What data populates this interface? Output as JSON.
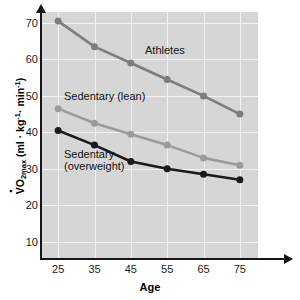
{
  "chart_data": {
    "type": "line",
    "title": "",
    "xlabel": "Age",
    "ylabel": "VO2max (ml · kg-1 · min-1)",
    "categories": [
      25,
      35,
      45,
      55,
      65,
      75
    ],
    "x": [
      25,
      35,
      45,
      55,
      65,
      75
    ],
    "xlim": [
      20,
      80
    ],
    "ylim": [
      5,
      73
    ],
    "xticks": [
      "25",
      "35",
      "45",
      "55",
      "65",
      "75"
    ],
    "yticks": [
      "10",
      "20",
      "30",
      "40",
      "50",
      "60",
      "70"
    ],
    "grid": true,
    "legend_position": "inline-annotations",
    "series": [
      {
        "name": "Athletes",
        "color": "#7d7d7d",
        "values": [
          70.5,
          63.5,
          59.0,
          54.5,
          50.0,
          45.0
        ]
      },
      {
        "name": "Sedentary (lean)",
        "color": "#9b9b9b",
        "values": [
          46.5,
          42.5,
          39.5,
          36.5,
          33.0,
          31.0
        ]
      },
      {
        "name": "Sedentary (overweight)",
        "color": "#1b1b1b",
        "values": [
          40.5,
          36.5,
          32.0,
          30.0,
          28.5,
          27.0
        ]
      }
    ],
    "annotations": [
      {
        "text": "Athletes"
      },
      {
        "text": "Sedentary (lean)"
      },
      {
        "text": "Sedentary",
        "text2": "(overweight)"
      }
    ],
    "plot_background": "#d6d6d6",
    "gridline_color": "#f2f2f2",
    "axis_color": "#161616"
  },
  "axis": {
    "x_title": "Age",
    "y_title_main": "VO",
    "y_title_sub": "2max",
    "y_title_rest_open": " (ml ",
    "y_title_mid": " kg",
    "y_title_sup1": "-1",
    "y_title_mid2": " min",
    "y_title_sup2": "-1",
    "y_title_close": ")"
  },
  "labels": {
    "athletes": "Athletes",
    "sedentary_lean": "Sedentary (lean)",
    "sedentary_overweight_line1": "Sedentary",
    "sedentary_overweight_line2": "(overweight)"
  }
}
